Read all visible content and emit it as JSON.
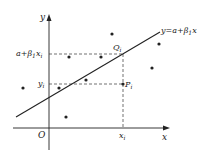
{
  "diagram": {
    "type": "scatter-with-regression-line",
    "axes": {
      "x_label": "x",
      "y_label": "y",
      "origin_label": "O"
    },
    "line": {
      "equation_label": "y=a+β₁x",
      "equation_parts": {
        "lhs": "y=a+β",
        "sub": "1",
        "rhs": "x"
      }
    },
    "annotations": {
      "predicted_value": {
        "text": "a+β",
        "sub": "1",
        "rest": "x",
        "rest_sub": "i"
      },
      "observed_value": {
        "text": "y",
        "sub": "i"
      },
      "x_tick": {
        "text": "x",
        "sub": "i"
      },
      "point_Q": {
        "text": "Q",
        "sub": "i"
      },
      "point_P": {
        "text": "P",
        "sub": "i"
      }
    },
    "colors": {
      "stroke": "#222222",
      "background": "#ffffff"
    }
  }
}
